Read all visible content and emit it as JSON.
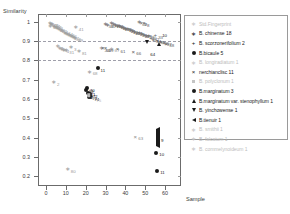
{
  "chart_data": {
    "type": "scatter",
    "title": "",
    "xlabel": "Sample",
    "ylabel": "Similarity",
    "xlim": [
      -4,
      68
    ],
    "ylim": [
      0.15,
      1.04
    ],
    "xticks": [
      0,
      10,
      20,
      30,
      40,
      50,
      60
    ],
    "yticks": [
      1,
      0.9,
      0.8,
      0.7,
      0.6,
      0.5,
      0.4,
      0.3,
      0.2
    ],
    "ytick_labels": [
      "1",
      "0.9",
      "0.8",
      "0.7",
      "0.6",
      "0.5",
      "0.4",
      "0.3",
      "0.2"
    ],
    "xtick_labels": [
      "0",
      "10",
      "20",
      "30",
      "40",
      "50",
      "60"
    ],
    "grid": "dashed horizontal at 0.9 and 0.8",
    "gridlines_y": [
      0.9,
      0.8
    ],
    "legend_position": "right",
    "series": [
      {
        "name": "Std.Fingerprint",
        "marker": "asterisk",
        "color": "#9a9a9a",
        "count": null,
        "points": [
          {
            "x": 2.0,
            "y": 0.993,
            "label": "43"
          },
          {
            "x": 2.6,
            "y": 0.99,
            "label": "45"
          },
          {
            "x": 3.2,
            "y": 0.986,
            "label": "44"
          },
          {
            "x": 2.2,
            "y": 0.978,
            "label": "46"
          },
          {
            "x": 3.8,
            "y": 0.98,
            "label": "47"
          },
          {
            "x": 4.6,
            "y": 0.973,
            "label": "48"
          },
          {
            "x": 5.6,
            "y": 0.966,
            "label": "49"
          },
          {
            "x": 6.6,
            "y": 0.962,
            "label": "52"
          },
          {
            "x": 7.4,
            "y": 0.955,
            "label": "51"
          },
          {
            "x": 8.4,
            "y": 0.95,
            "label": "53"
          },
          {
            "x": 9.6,
            "y": 0.944,
            "label": "54"
          },
          {
            "x": 10.6,
            "y": 0.938,
            "label": "55"
          },
          {
            "x": 11.6,
            "y": 0.932,
            "label": "56"
          },
          {
            "x": 12.6,
            "y": 0.926,
            "label": "57"
          },
          {
            "x": 13.6,
            "y": 0.92,
            "label": "58"
          },
          {
            "x": 14.6,
            "y": 0.914,
            "label": "59"
          },
          {
            "x": 15.0,
            "y": 0.972,
            "label": "41"
          },
          {
            "x": 6.0,
            "y": 0.872,
            "label": "7"
          },
          {
            "x": 7.0,
            "y": 0.866,
            "label": "6"
          },
          {
            "x": 8.0,
            "y": 0.861,
            "label": "5"
          },
          {
            "x": 9.0,
            "y": 0.856,
            "label": "4"
          },
          {
            "x": 10.2,
            "y": 0.852,
            "label": "31"
          },
          {
            "x": 12.6,
            "y": 0.868,
            "label": "3"
          },
          {
            "x": 16.6,
            "y": 0.848,
            "label": "81"
          },
          {
            "x": 4.0,
            "y": 0.686,
            "label": "2"
          },
          {
            "x": 11.0,
            "y": 0.236,
            "label": "80"
          },
          {
            "x": 28.0,
            "y": 0.862,
            "label": "20"
          },
          {
            "x": 33.0,
            "y": 0.86,
            "label": "67"
          }
        ]
      },
      {
        "name": "B. chinense  18",
        "marker": "asterisk",
        "color": "#6d6d6d",
        "count": 18,
        "points": [
          {
            "x": 33.0,
            "y": 0.992,
            "label": "12"
          },
          {
            "x": 34.0,
            "y": 0.988,
            "label": "13"
          },
          {
            "x": 35.0,
            "y": 0.984,
            "label": "14"
          },
          {
            "x": 36.0,
            "y": 0.98,
            "label": "15"
          },
          {
            "x": 37.0,
            "y": 0.976,
            "label": "16"
          },
          {
            "x": 38.2,
            "y": 0.972,
            "label": "17"
          },
          {
            "x": 39.2,
            "y": 0.968,
            "label": "18"
          },
          {
            "x": 40.2,
            "y": 0.964,
            "label": "19"
          },
          {
            "x": 41.2,
            "y": 0.96,
            "label": "21"
          },
          {
            "x": 42.4,
            "y": 0.956,
            "label": "22"
          },
          {
            "x": 43.6,
            "y": 0.952,
            "label": "23"
          },
          {
            "x": 44.6,
            "y": 0.948,
            "label": "24"
          },
          {
            "x": 45.8,
            "y": 0.944,
            "label": "25"
          },
          {
            "x": 47.0,
            "y": 0.94,
            "label": "26"
          },
          {
            "x": 48.2,
            "y": 0.936,
            "label": "27"
          },
          {
            "x": 49.4,
            "y": 0.932,
            "label": "28"
          },
          {
            "x": 50.6,
            "y": 0.928,
            "label": "29"
          },
          {
            "x": 51.8,
            "y": 0.924,
            "label": "30"
          }
        ]
      },
      {
        "name": "B. scorzonerifolium  2",
        "marker": "plus",
        "color": "#6d6d6d",
        "count": 2,
        "points": [
          {
            "x": 53.0,
            "y": 0.918,
            "label": "32"
          },
          {
            "x": 55.0,
            "y": 0.93,
            "label": "33"
          }
        ]
      },
      {
        "name": "B.bicaule  5",
        "marker": "filled-circle",
        "color": "#1a1a1a",
        "count": 5,
        "points": [
          {
            "x": 20.6,
            "y": 0.656,
            "label": "70"
          },
          {
            "x": 21.0,
            "y": 0.632,
            "label": "71"
          },
          {
            "x": 22.0,
            "y": 0.626,
            "label": "72"
          },
          {
            "x": 21.8,
            "y": 0.612,
            "label": "73"
          },
          {
            "x": 22.8,
            "y": 0.608,
            "label": "74"
          }
        ]
      },
      {
        "name": "B. longiradiatum  1",
        "marker": "asterisk",
        "color": "#b8b8b8",
        "count": 1,
        "points": [
          {
            "x": 23.8,
            "y": 0.604,
            "label": "75"
          }
        ]
      },
      {
        "name": "nerchianclisc  11",
        "marker": "x",
        "color": "#5a5a5a",
        "count": 11,
        "points": [
          {
            "x": 30.0,
            "y": 0.862,
            "label": "59"
          },
          {
            "x": 36.0,
            "y": 0.858,
            "label": "61"
          },
          {
            "x": 44.0,
            "y": 0.844,
            "label": "66"
          },
          {
            "x": 28.6,
            "y": 0.864,
            "label": "60"
          },
          {
            "x": 48.0,
            "y": 0.996,
            "label": "9"
          },
          {
            "x": 49.4,
            "y": 0.992,
            "label": "8"
          },
          {
            "x": 54.0,
            "y": 0.908,
            "label": "34"
          },
          {
            "x": 56.0,
            "y": 0.902,
            "label": "35"
          },
          {
            "x": 58.0,
            "y": 0.896,
            "label": "36"
          },
          {
            "x": 59.4,
            "y": 0.89,
            "label": "37"
          },
          {
            "x": 60.6,
            "y": 0.886,
            "label": "38"
          }
        ]
      },
      {
        "name": "B. polyclonum  1",
        "marker": "square",
        "color": "#b8b8b8",
        "count": 1,
        "points": [
          {
            "x": 21.6,
            "y": 0.62,
            "label": "76"
          }
        ]
      },
      {
        "name": "B.marginatum  3",
        "marker": "filled-circle",
        "color": "#1a1a1a",
        "count": 3,
        "points": [
          {
            "x": 55.6,
            "y": 0.322,
            "label": "10"
          },
          {
            "x": 56.0,
            "y": 0.228,
            "label": "11"
          },
          {
            "x": 26.0,
            "y": 0.76,
            "label": "11"
          }
        ]
      },
      {
        "name": "B.marginatum var. stenophyllum  1",
        "marker": "triangle-up",
        "color": "#1a1a1a",
        "count": 1,
        "points": [
          {
            "x": 57.0,
            "y": 0.938,
            "label": "10"
          }
        ]
      },
      {
        "name": "B. yinchowense  1",
        "marker": "triangle-down",
        "color": "#1a1a1a",
        "count": 1,
        "points": [
          {
            "x": 51.0,
            "y": 0.84,
            "label": "64"
          }
        ]
      },
      {
        "name": "B.tienuir  1",
        "marker": "triangle-left",
        "color": "#1a1a1a",
        "count": 1,
        "points": [
          {
            "x": 56.4,
            "y": 0.396,
            "label": "9"
          }
        ]
      },
      {
        "name": "B. smithii  1",
        "marker": "asterisk",
        "color": "#dcdcdc",
        "count": 1,
        "points": []
      },
      {
        "name": "B. falcatum  1",
        "marker": "asterisk",
        "color": "#dcdcdc",
        "count": 1,
        "points": []
      },
      {
        "name": "B. commelynoideum  1",
        "marker": "asterisk",
        "color": "#dcdcdc",
        "count": 1,
        "points": []
      }
    ],
    "extra_points": [
      {
        "x": 45.0,
        "y": 0.405,
        "label": "63",
        "marker": "x",
        "color": "#8a8a8a"
      },
      {
        "x": 22.0,
        "y": 0.74,
        "label": "68",
        "marker": "asterisk",
        "color": "#9a9a9a"
      },
      {
        "x": 20.0,
        "y": 0.648,
        "label": "69",
        "marker": "filled-circle",
        "color": "#1a1a1a"
      },
      {
        "x": 30.0,
        "y": 0.988,
        "label": "39",
        "marker": "asterisk",
        "color": "#6d6d6d"
      },
      {
        "x": 31.0,
        "y": 0.984,
        "label": "40",
        "marker": "asterisk",
        "color": "#6d6d6d"
      },
      {
        "x": 47.0,
        "y": 0.998,
        "label": "42",
        "marker": "asterisk",
        "color": "#6d6d6d"
      }
    ]
  },
  "axes": {
    "y_title": "Similarity",
    "x_title": "Sample"
  },
  "legend": {
    "items": [
      {
        "marker": "asterisk",
        "label": "Std.Fingerprint",
        "faded": true
      },
      {
        "marker": "asterisk",
        "label": "B. chinense  18",
        "faded": false
      },
      {
        "marker": "plus",
        "label": "B. scorzonerifolium  2",
        "faded": false
      },
      {
        "marker": "filled-circle",
        "label": "B.bicaule  5",
        "faded": false
      },
      {
        "marker": "asterisk",
        "label": "B. longiradiatum  1",
        "faded": true
      },
      {
        "marker": "x",
        "label": "nerchianclisc  11",
        "faded": false
      },
      {
        "marker": "square",
        "label": "B. polyclonum  1",
        "faded": true
      },
      {
        "marker": "filled-circle",
        "label": "B.marginatum  3",
        "faded": false
      },
      {
        "marker": "triangle-up",
        "label": "B.marginatum var. stenophyllum  1",
        "faded": false
      },
      {
        "marker": "triangle-down",
        "label": "B. yinchowense  1",
        "faded": false
      },
      {
        "marker": "triangle-left",
        "label": "B.tienuir  1",
        "faded": false
      },
      {
        "marker": "asterisk",
        "label": "B. smithii  1",
        "faded": true
      },
      {
        "marker": "asterisk",
        "label": "B. falcatum  1",
        "faded": true
      },
      {
        "marker": "asterisk",
        "label": "B. commelynoideum  1",
        "faded": true
      }
    ]
  }
}
